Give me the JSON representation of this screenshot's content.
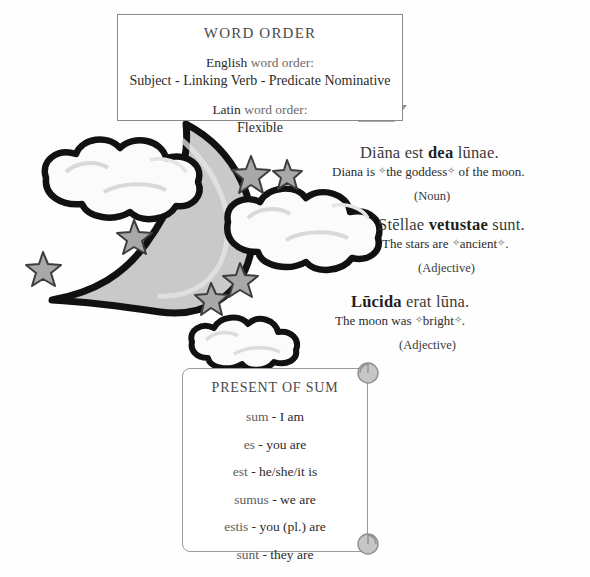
{
  "word_order_box": {
    "title": "WORD ORDER",
    "english_label": "English",
    "english_label_rest": " word order:",
    "english_order": "Subject - Linking Verb - Predicate Nominative",
    "latin_label": "Latin",
    "latin_label_rest": " word order:",
    "latin_order": "Flexible"
  },
  "examples": [
    {
      "latin_pre": "Diāna est ",
      "latin_bold": "dea",
      "latin_post": " lūnae.",
      "english_pre": "Diana is ",
      "english_marked": "the goddess",
      "english_post": " of the moon.",
      "part_of_speech": "(Noun)"
    },
    {
      "latin_pre": "Stēllae ",
      "latin_bold": "vetustae",
      "latin_post": " sunt.",
      "english_pre": "The stars are ",
      "english_marked": "ancient",
      "english_post": ".",
      "part_of_speech": "(Adjective)"
    },
    {
      "latin_pre": "",
      "latin_bold": "Lūcida",
      "latin_post": " erat lūna.",
      "english_pre": "The moon was ",
      "english_marked": "bright",
      "english_post": ".",
      "part_of_speech": "(Adjective)"
    }
  ],
  "scroll": {
    "title": "PRESENT OF SUM",
    "items": [
      {
        "form": "sum",
        "sep": " - ",
        "meaning": "I am"
      },
      {
        "form": "es",
        "sep": " - ",
        "meaning": "you are"
      },
      {
        "form": "est",
        "sep": " - ",
        "meaning": "he/she/it is"
      },
      {
        "form": "sumus",
        "sep": " - ",
        "meaning": "we are"
      },
      {
        "form": "estis",
        "sep": " - ",
        "meaning": "you (pl.) are"
      },
      {
        "form": "sunt",
        "sep": " - ",
        "meaning": "they are"
      }
    ]
  },
  "illustration": {
    "moon_name": "crescent-moon",
    "cloud_count": 3,
    "star_count": 6,
    "colors": {
      "moon_fill": "#c9c9c9",
      "outline": "#111111",
      "cloud_fill": "#fbfbfb",
      "cloud_shade": "#dcdcdc",
      "star_fill": "#a8a8a8",
      "box_border": "#8a8a8a",
      "text": "#2b2b2b"
    }
  },
  "marks": {
    "glyph": "✧"
  }
}
